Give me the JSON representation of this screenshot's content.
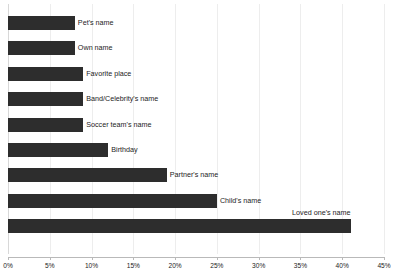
{
  "chart_data": {
    "type": "bar",
    "orientation": "horizontal",
    "title": "",
    "subtitle": "",
    "xlabel": "",
    "ylabel": "",
    "xlim": [
      0,
      45
    ],
    "xunit": "%",
    "grid": true,
    "legend": false,
    "legend_position": "none",
    "bar_color": "#2d2d2d",
    "gridline_color": "#ededed",
    "axis_color": "#b9b9b9",
    "xticks": [
      0,
      5,
      10,
      15,
      20,
      25,
      30,
      35,
      40,
      45
    ],
    "xtick_labels": [
      "0%",
      "5%",
      "10%",
      "15%",
      "20%",
      "25%",
      "30%",
      "35%",
      "40%",
      "45%"
    ],
    "categories": [
      "Pet's name",
      "Own name",
      "Favorite place",
      "Band/Celebrity's name",
      "Soccer team's name",
      "Birthday",
      "Partner's name",
      "Child's name",
      "Loved one's name"
    ],
    "values": [
      8,
      8,
      9,
      9,
      9,
      12,
      19,
      25,
      41
    ],
    "bars": [
      {
        "label": "Pet's name",
        "value": 8,
        "label_placement": "right"
      },
      {
        "label": "Own name",
        "value": 8,
        "label_placement": "right"
      },
      {
        "label": "Favorite place",
        "value": 9,
        "label_placement": "right"
      },
      {
        "label": "Band/Celebrity's name",
        "value": 9,
        "label_placement": "right"
      },
      {
        "label": "Soccer team's name",
        "value": 9,
        "label_placement": "right"
      },
      {
        "label": "Birthday",
        "value": 12,
        "label_placement": "right"
      },
      {
        "label": "Partner's name",
        "value": 19,
        "label_placement": "right"
      },
      {
        "label": "Child's name",
        "value": 25,
        "label_placement": "right"
      },
      {
        "label": "Loved one's name",
        "value": 41,
        "label_placement": "above-end"
      }
    ]
  }
}
